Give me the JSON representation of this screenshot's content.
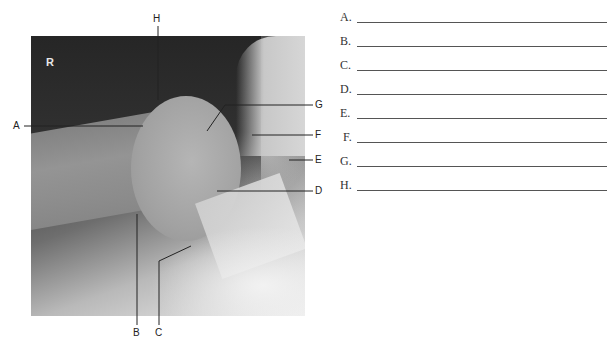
{
  "figure": {
    "orientation_marker": "R",
    "callouts": [
      {
        "id": "A",
        "label": "A"
      },
      {
        "id": "B",
        "label": "B"
      },
      {
        "id": "C",
        "label": "C"
      },
      {
        "id": "D",
        "label": "D"
      },
      {
        "id": "E",
        "label": "E"
      },
      {
        "id": "F",
        "label": "F"
      },
      {
        "id": "G",
        "label": "G"
      },
      {
        "id": "H",
        "label": "H"
      }
    ]
  },
  "answers": {
    "rows": [
      {
        "letter": "A.",
        "value": ""
      },
      {
        "letter": "B.",
        "value": ""
      },
      {
        "letter": "C.",
        "value": ""
      },
      {
        "letter": "D.",
        "value": ""
      },
      {
        "letter": "E.",
        "value": ""
      },
      {
        "letter": "F.",
        "value": ""
      },
      {
        "letter": "G.",
        "value": ""
      },
      {
        "letter": "H.",
        "value": ""
      }
    ]
  }
}
